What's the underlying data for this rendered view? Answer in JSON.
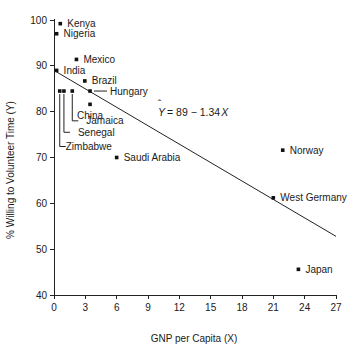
{
  "chart_data": {
    "type": "scatter",
    "title": "",
    "xlabel": "GNP per Capita (X)",
    "ylabel": "% Willing to Volunteer Time (Y)",
    "xlim": [
      0,
      27
    ],
    "ylim": [
      40,
      100
    ],
    "xticks": [
      0,
      3,
      6,
      9,
      12,
      15,
      18,
      21,
      24,
      27
    ],
    "yticks": [
      40,
      50,
      60,
      70,
      80,
      90,
      100
    ],
    "xtick_labels": [
      "0",
      "3",
      "6",
      "9",
      "12",
      "15",
      "18",
      "21",
      "24",
      "27"
    ],
    "ytick_labels": [
      "40",
      "50",
      "60",
      "70",
      "80",
      "90",
      "100"
    ],
    "grid": false,
    "legend": "none",
    "annotation": "Y = 89 − 1.34X",
    "annotation_parts": {
      "y_hat": "Y",
      "hat": "ˆ",
      "rest": "= 89 − 1.34",
      "x_var": "X"
    },
    "regression": {
      "intercept": 89,
      "slope": -1.34,
      "x_start": 0,
      "y_start": 89,
      "x_end": 27,
      "y_end": 52.8
    },
    "points": [
      {
        "label": "Kenya",
        "x": 0.6,
        "y": 99.2,
        "label_dx": 7,
        "label_dy": 3.5,
        "anchor": "start"
      },
      {
        "label": "Nigeria",
        "x": 0.25,
        "y": 97.0,
        "label_dx": 7,
        "label_dy": 3.5,
        "anchor": "start"
      },
      {
        "label": "Mexico",
        "x": 2.15,
        "y": 91.4,
        "label_dx": 7,
        "label_dy": 3.5,
        "anchor": "start"
      },
      {
        "label": "India",
        "x": 0.25,
        "y": 89.0,
        "label_dx": 7,
        "label_dy": 3.5,
        "anchor": "start"
      },
      {
        "label": "Brazil",
        "x": 2.95,
        "y": 86.7,
        "label_dx": 7,
        "label_dy": 3.5,
        "anchor": "start"
      },
      {
        "label": "Hungary",
        "x": 3.45,
        "y": 84.5,
        "label_dx": 20,
        "label_dy": 3.5,
        "anchor": "start"
      },
      {
        "label": "China",
        "x": 3.45,
        "y": 81.6,
        "label_dx": 0,
        "label_dy": 15,
        "anchor": "middle"
      },
      {
        "label": "Saudi Arabia",
        "x": 6.0,
        "y": 70.0,
        "label_dx": 7,
        "label_dy": 3.5,
        "anchor": "start"
      },
      {
        "label": "Norway",
        "x": 21.9,
        "y": 71.6,
        "label_dx": 7,
        "label_dy": 3.5,
        "anchor": "start"
      },
      {
        "label": "West Germany",
        "x": 21.0,
        "y": 61.2,
        "label_dx": 7,
        "label_dy": 3.5,
        "anchor": "start"
      },
      {
        "label": "Japan",
        "x": 23.4,
        "y": 45.6,
        "label_dx": 7,
        "label_dy": 3.5,
        "anchor": "start"
      }
    ],
    "leader_points": [
      {
        "label": "Jamaica",
        "x": 1.75,
        "y": 84.5,
        "elbow_y": 78.0,
        "label_x_offset": 8
      },
      {
        "label": "Senegal",
        "x": 0.95,
        "y": 84.5,
        "elbow_y": 75.5,
        "label_x_offset": 8
      },
      {
        "label": "Zimbabwe",
        "x": 0.55,
        "y": 84.5,
        "elbow_y": 72.4,
        "label_x_offset": 0
      }
    ]
  }
}
